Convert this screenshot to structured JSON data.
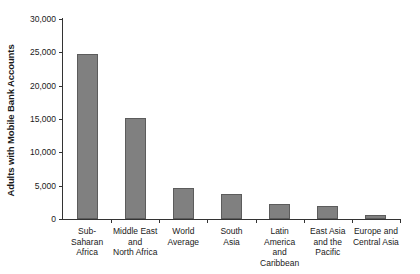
{
  "chart_data": {
    "type": "bar",
    "title": "",
    "xlabel": "",
    "ylabel": "Adults with Mobile Bank Accounts",
    "ylim": [
      0,
      30000
    ],
    "yticks": [
      0,
      5000,
      10000,
      15000,
      20000,
      25000,
      30000
    ],
    "ytick_labels": [
      "0",
      "5,000",
      "10,000",
      "15,000",
      "20,000",
      "25,000",
      "30,000"
    ],
    "grid": false,
    "legend": false,
    "bar_color": "#808080",
    "bar_edge_color": "#5c5c5c",
    "axis_color": "#333333",
    "categories": [
      "Sub-Saharan\nAfrica",
      "Middle East\nand\nNorth Africa",
      "World\nAverage",
      "South\nAsia",
      "Latin America\nand Caribbean",
      "East Asia\nand the\nPacific",
      "Europe and\nCentral Asia"
    ],
    "values": [
      24800,
      15200,
      4600,
      3700,
      2200,
      1900,
      600
    ]
  }
}
